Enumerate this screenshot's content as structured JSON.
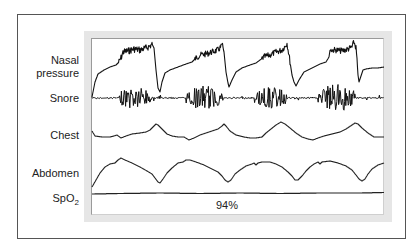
{
  "chart_data": {
    "type": "line",
    "title": "",
    "xlabel": "",
    "ylabel": "",
    "grid": false,
    "legend": "none",
    "channels": [
      {
        "name": "Nasal pressure",
        "label_lines": [
          "Nasal",
          "pressure"
        ]
      },
      {
        "name": "Snore"
      },
      {
        "name": "Chest"
      },
      {
        "name": "Abdomen"
      },
      {
        "name": "SpO2",
        "label_main": "SpO",
        "label_sub": "2",
        "value_annotation": "94%"
      }
    ],
    "series": [
      {
        "name": "Nasal pressure",
        "stroke": "#111111",
        "width": 1.1,
        "noise": [
          [
            118,
            152,
            3.5
          ],
          [
            195,
            223,
            3
          ],
          [
            262,
            290,
            3
          ],
          [
            330,
            357,
            3
          ]
        ],
        "points": [
          [
            92,
            97
          ],
          [
            95,
            82
          ],
          [
            98,
            74
          ],
          [
            104,
            70
          ],
          [
            110,
            67
          ],
          [
            116,
            65
          ],
          [
            119,
            62
          ],
          [
            121,
            58
          ],
          [
            123,
            52
          ],
          [
            128,
            51
          ],
          [
            134,
            49
          ],
          [
            140,
            50
          ],
          [
            146,
            48
          ],
          [
            150,
            46
          ],
          [
            152,
            44
          ],
          [
            154,
            48
          ],
          [
            156,
            70
          ],
          [
            158,
            88
          ],
          [
            160,
            92
          ],
          [
            162,
            82
          ],
          [
            165,
            73
          ],
          [
            170,
            70
          ],
          [
            178,
            67
          ],
          [
            186,
            64
          ],
          [
            192,
            62
          ],
          [
            196,
            58
          ],
          [
            200,
            55
          ],
          [
            206,
            54
          ],
          [
            212,
            52
          ],
          [
            218,
            50
          ],
          [
            221,
            47
          ],
          [
            222,
            44
          ],
          [
            224,
            52
          ],
          [
            226,
            72
          ],
          [
            228,
            83
          ],
          [
            229,
            87
          ],
          [
            232,
            80
          ],
          [
            236,
            72
          ],
          [
            242,
            68
          ],
          [
            250,
            65
          ],
          [
            256,
            63
          ],
          [
            260,
            60
          ],
          [
            264,
            57
          ],
          [
            270,
            55
          ],
          [
            276,
            52
          ],
          [
            282,
            50
          ],
          [
            286,
            45
          ],
          [
            287,
            43
          ],
          [
            289,
            55
          ],
          [
            292,
            75
          ],
          [
            294,
            82
          ],
          [
            296,
            86
          ],
          [
            299,
            80
          ],
          [
            304,
            72
          ],
          [
            312,
            68
          ],
          [
            320,
            64
          ],
          [
            326,
            62
          ],
          [
            329,
            57
          ],
          [
            330,
            50
          ],
          [
            336,
            50
          ],
          [
            342,
            51
          ],
          [
            348,
            49
          ],
          [
            352,
            47
          ],
          [
            354,
            42
          ],
          [
            356,
            48
          ],
          [
            357,
            60
          ],
          [
            358,
            75
          ],
          [
            359,
            82
          ],
          [
            361,
            76
          ],
          [
            363,
            70
          ],
          [
            366,
            69
          ],
          [
            372,
            68
          ],
          [
            378,
            68
          ],
          [
            384,
            67
          ]
        ]
      },
      {
        "name": "Snore",
        "stroke": "#111111",
        "width": 1,
        "baseline": 98,
        "bursts": [
          [
            119,
            152,
            12
          ],
          [
            186,
            223,
            12
          ],
          [
            254,
            288,
            11
          ],
          [
            318,
            356,
            14
          ]
        ]
      },
      {
        "name": "Chest",
        "stroke": "#222222",
        "width": 1.1,
        "points": [
          [
            92,
            131
          ],
          [
            95,
            136
          ],
          [
            102,
            137
          ],
          [
            110,
            137
          ],
          [
            114,
            136
          ],
          [
            117,
            135
          ],
          [
            121,
            138
          ],
          [
            126,
            136
          ],
          [
            132,
            134
          ],
          [
            140,
            133
          ],
          [
            146,
            132
          ],
          [
            150,
            130
          ],
          [
            154,
            126
          ],
          [
            156,
            124
          ],
          [
            158,
            125
          ],
          [
            162,
            129
          ],
          [
            167,
            134
          ],
          [
            172,
            136
          ],
          [
            178,
            137
          ],
          [
            184,
            137
          ],
          [
            189,
            140
          ],
          [
            194,
            138
          ],
          [
            200,
            135
          ],
          [
            206,
            133
          ],
          [
            212,
            131
          ],
          [
            218,
            129
          ],
          [
            222,
            126
          ],
          [
            224,
            124
          ],
          [
            226,
            126
          ],
          [
            230,
            131
          ],
          [
            236,
            135
          ],
          [
            244,
            137
          ],
          [
            250,
            138
          ],
          [
            256,
            138
          ],
          [
            262,
            137
          ],
          [
            266,
            133
          ],
          [
            271,
            129
          ],
          [
            276,
            125
          ],
          [
            281,
            122
          ],
          [
            285,
            124
          ],
          [
            290,
            128
          ],
          [
            296,
            133
          ],
          [
            302,
            137
          ],
          [
            308,
            139
          ],
          [
            313,
            140
          ],
          [
            318,
            138
          ],
          [
            324,
            136
          ],
          [
            332,
            134
          ],
          [
            340,
            132
          ],
          [
            346,
            129
          ],
          [
            352,
            125
          ],
          [
            355,
            123
          ],
          [
            358,
            124
          ],
          [
            362,
            128
          ],
          [
            368,
            133
          ],
          [
            374,
            137
          ],
          [
            384,
            137
          ]
        ]
      },
      {
        "name": "Abdomen",
        "stroke": "#222222",
        "width": 1.1,
        "points": [
          [
            92,
            187
          ],
          [
            96,
            180
          ],
          [
            100,
            173
          ],
          [
            105,
            167
          ],
          [
            110,
            164
          ],
          [
            115,
            163
          ],
          [
            118,
            160
          ],
          [
            121,
            158
          ],
          [
            125,
            160
          ],
          [
            132,
            163
          ],
          [
            140,
            167
          ],
          [
            147,
            171
          ],
          [
            152,
            174
          ],
          [
            155,
            178
          ],
          [
            158,
            182
          ],
          [
            160,
            183
          ],
          [
            163,
            179
          ],
          [
            167,
            173
          ],
          [
            172,
            168
          ],
          [
            178,
            163
          ],
          [
            183,
            162
          ],
          [
            186,
            160
          ],
          [
            190,
            160
          ],
          [
            196,
            162
          ],
          [
            204,
            165
          ],
          [
            212,
            169
          ],
          [
            218,
            172
          ],
          [
            222,
            176
          ],
          [
            225,
            180
          ],
          [
            228,
            182
          ],
          [
            231,
            180
          ],
          [
            235,
            174
          ],
          [
            240,
            170
          ],
          [
            246,
            166
          ],
          [
            252,
            164
          ],
          [
            254,
            163
          ],
          [
            256,
            165
          ],
          [
            258,
            163
          ],
          [
            262,
            162
          ],
          [
            270,
            162
          ],
          [
            276,
            164
          ],
          [
            282,
            167
          ],
          [
            288,
            172
          ],
          [
            292,
            176
          ],
          [
            295,
            180
          ],
          [
            298,
            180
          ],
          [
            302,
            176
          ],
          [
            306,
            171
          ],
          [
            310,
            167
          ],
          [
            314,
            164
          ],
          [
            318,
            162
          ],
          [
            320,
            164
          ],
          [
            322,
            162
          ],
          [
            330,
            161
          ],
          [
            338,
            163
          ],
          [
            346,
            166
          ],
          [
            352,
            170
          ],
          [
            356,
            175
          ],
          [
            359,
            179
          ],
          [
            362,
            181
          ],
          [
            365,
            179
          ],
          [
            368,
            174
          ],
          [
            372,
            169
          ],
          [
            378,
            165
          ],
          [
            384,
            163
          ]
        ]
      },
      {
        "name": "SpO2",
        "stroke": "#222222",
        "width": 1.2,
        "points": [
          [
            92,
            194
          ],
          [
            120,
            193.5
          ],
          [
            160,
            193
          ],
          [
            200,
            193.5
          ],
          [
            240,
            193
          ],
          [
            280,
            193.5
          ],
          [
            320,
            193
          ],
          [
            360,
            193
          ],
          [
            384,
            192.5
          ]
        ]
      }
    ]
  },
  "labels": {
    "nasal_line1": "Nasal",
    "nasal_line2": "pressure",
    "snore": "Snore",
    "chest": "Chest",
    "abdomen": "Abdomen",
    "spo2_main": "SpO",
    "spo2_sub": "2",
    "spo2_value": "94%"
  }
}
